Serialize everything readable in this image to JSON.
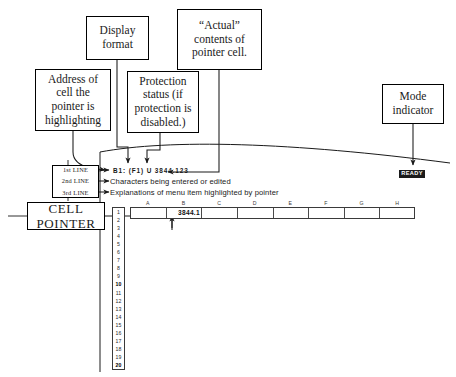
{
  "figure": {
    "kind": "annotated-spreadsheet-control-panel",
    "ink_color": "#1a1a1a"
  },
  "callouts": [
    {
      "id": "display-format",
      "lines": [
        "Display",
        "format"
      ]
    },
    {
      "id": "actual-contents",
      "lines": [
        "“Actual”",
        "contents of",
        "pointer cell."
      ]
    },
    {
      "id": "cell-address",
      "lines": [
        "Address of",
        "cell the",
        "pointer is",
        "highlighting"
      ]
    },
    {
      "id": "protection",
      "lines": [
        "Protection",
        "status (if",
        "protection is",
        "disabled.)"
      ]
    },
    {
      "id": "mode-indicator",
      "lines": [
        "Mode",
        "indicator"
      ]
    },
    {
      "id": "cell-pointer",
      "lines": [
        "CELL",
        "POINTER"
      ]
    }
  ],
  "control_panel": {
    "line_labels": [
      "1st LINE",
      "2nd LINE",
      "3rd LINE"
    ],
    "line1": {
      "address": "B1:",
      "format": "(F1)",
      "protection": "U",
      "contents": "3844.123",
      "full": "B1:  (F1)  U  3844.123"
    },
    "line2": "Characters being entered or edited",
    "line3": "Explanations of menu item highlighted by pointer"
  },
  "mode": {
    "indicator_label": "READY"
  },
  "spreadsheet": {
    "columns": [
      "A",
      "B",
      "C",
      "D",
      "E",
      "F",
      "G",
      "H"
    ],
    "rows": [
      "1",
      "2",
      "3",
      "4",
      "5",
      "6",
      "7",
      "8",
      "9",
      "10",
      "11",
      "12",
      "13",
      "14",
      "15",
      "16",
      "17",
      "18",
      "19",
      "20"
    ],
    "bold_rows": [
      "10",
      "20"
    ],
    "pointer_cell": "B1",
    "pointer_cell_value": "3844.1"
  }
}
